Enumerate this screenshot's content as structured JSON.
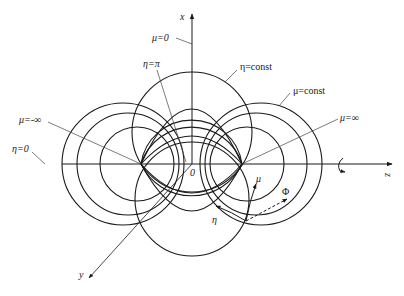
{
  "figure": {
    "colors": {
      "stroke": "#1a1a1a",
      "leader": "#444444",
      "background": "#ffffff"
    }
  },
  "axes": {
    "x_label": "x",
    "y_label": "y",
    "z_label": "z",
    "origin_label": "0"
  },
  "labels": {
    "mu_zero": "μ=0",
    "eta_pi": "η=π",
    "eta_const": "η=const",
    "mu_const": "μ=const",
    "mu_neg_inf": "μ=-∞",
    "mu_pos_inf": "μ=∞",
    "eta_zero": "η=0"
  },
  "local_triad": {
    "mu": "μ",
    "eta": "η",
    "phi": "Φ"
  },
  "geometry": {
    "origin": [
      192,
      164
    ],
    "foci": [
      [
        141,
        164
      ],
      [
        242,
        164
      ]
    ],
    "mu_circles_left": [
      {
        "cx": 123,
        "r": 61
      },
      {
        "cx": 128,
        "r": 51
      },
      {
        "cx": 137,
        "r": 37
      }
    ],
    "mu_circles_right": [
      {
        "cx": 261,
        "r": 61
      },
      {
        "cx": 256,
        "r": 51
      },
      {
        "cx": 247,
        "r": 37
      }
    ],
    "eta_circles": [
      {
        "cy": 132,
        "r": 60
      },
      {
        "cy": 199,
        "r": 57
      }
    ],
    "eta_arcs_upper": [
      {
        "cy": 150,
        "r": 53
      },
      {
        "cy": 172,
        "r": 51
      }
    ],
    "eta_arcs_lower": [
      {
        "cy": 142,
        "r": 56
      },
      {
        "cy": 156,
        "r": 52
      }
    ]
  }
}
